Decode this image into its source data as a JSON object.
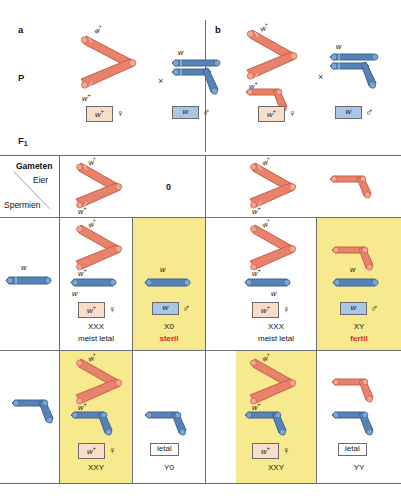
{
  "figure": {
    "type": "genetics-punnett-square",
    "language": "de",
    "panels": [
      "a",
      "b"
    ],
    "colors": {
      "maternal_chromosome": "#e8826b",
      "paternal_chromosome": "#5583b8",
      "highlight_cell": "#f7e98e",
      "grid_line": "#4a6fa5",
      "grid_line_thick": "#6e6f74",
      "female_chip": "#f8ddc8",
      "male_chip": "#a8c6e8",
      "annotation_red": "#e2251b"
    }
  },
  "labels": {
    "panel_a": "a",
    "panel_b": "b",
    "parental_row": "P",
    "f1_row": "F",
    "f1_sub": "1",
    "gameten": "Gameten",
    "eier": "Eier",
    "spermien": "Spermien",
    "cross_symbol": "×",
    "nullo_gamete": "0",
    "allele_wildtype": "w",
    "allele_wildtype_sup": "+",
    "allele_mutant": "w",
    "female_symbol": "♀",
    "male_symbol": "♂"
  },
  "parents": {
    "a": {
      "mother": {
        "chip": "w",
        "chip_sup": "+",
        "sex": "♀",
        "chromosome_labels": [
          "w+",
          "w+"
        ],
        "structure": "attached-X (compound X), no Y"
      },
      "father": {
        "chip": "w",
        "chip_sup": "",
        "sex": "♂",
        "chromosome_labels": [
          "w"
        ],
        "structure": "X (w) plus bent Y"
      }
    },
    "b": {
      "mother": {
        "chip": "w",
        "chip_sup": "+",
        "sex": "♀",
        "chromosome_labels": [
          "w+",
          "w+"
        ],
        "structure": "attached-X (compound X) plus Y"
      },
      "father": {
        "chip": "w",
        "chip_sup": "",
        "sex": "♂",
        "chromosome_labels": [
          "w"
        ],
        "structure": "X (w) plus bent Y"
      }
    }
  },
  "grid": {
    "a": {
      "egg_gametes": [
        {
          "id": "egg-a-1",
          "label": "attached-X",
          "marks": [
            "w+",
            "w+"
          ],
          "text": ""
        },
        {
          "id": "egg-a-2",
          "label": "nullo",
          "marks": [],
          "text": "0"
        }
      ],
      "sperm_gametes": [
        {
          "id": "sperm-a-1",
          "label": "X",
          "marks": [
            "w"
          ]
        },
        {
          "id": "sperm-a-2",
          "label": "Y",
          "marks": []
        }
      ],
      "cells": [
        {
          "id": "cell-a-11",
          "genotype": "XXX",
          "note": "meist letal",
          "note_color": "black",
          "highlight": false,
          "chip": "w",
          "chip_sup": "+",
          "chip_class": "female",
          "sex": "♀",
          "chromosome_marks": [
            "w+",
            "w+",
            "w"
          ]
        },
        {
          "id": "cell-a-12",
          "genotype": "X0",
          "note": "steril",
          "note_color": "red",
          "highlight": true,
          "chip": "w",
          "chip_sup": "",
          "chip_class": "male",
          "sex": "♂",
          "chromosome_marks": [
            "w"
          ]
        },
        {
          "id": "cell-a-21",
          "genotype": "XXY",
          "note": "",
          "note_color": "black",
          "highlight": true,
          "chip": "w",
          "chip_sup": "+",
          "chip_class": "female",
          "sex": "♀",
          "chromosome_marks": [
            "w+",
            "w+"
          ]
        },
        {
          "id": "cell-a-22",
          "genotype": "Y0",
          "note": "",
          "note_color": "black",
          "highlight": false,
          "chip": "letal",
          "chip_sup": "",
          "chip_class": "plain",
          "sex": "",
          "chromosome_marks": []
        }
      ]
    },
    "b": {
      "egg_gametes": [
        {
          "id": "egg-b-1",
          "label": "attached-X",
          "marks": [
            "w+",
            "w+"
          ],
          "text": ""
        },
        {
          "id": "egg-b-2",
          "label": "Y",
          "marks": [],
          "text": ""
        }
      ],
      "sperm_gametes": [
        {
          "id": "sperm-b-1",
          "label": "X",
          "marks": [
            "w"
          ]
        },
        {
          "id": "sperm-b-2",
          "label": "Y",
          "marks": []
        }
      ],
      "cells": [
        {
          "id": "cell-b-11",
          "genotype": "XXX",
          "note": "meist letal",
          "note_color": "black",
          "highlight": false,
          "chip": "w",
          "chip_sup": "+",
          "chip_class": "female",
          "sex": "♀",
          "chromosome_marks": [
            "w+",
            "w+",
            "w"
          ]
        },
        {
          "id": "cell-b-12",
          "genotype": "XY",
          "note": "fertil",
          "note_color": "red",
          "highlight": true,
          "chip": "w",
          "chip_sup": "",
          "chip_class": "male",
          "sex": "♂",
          "chromosome_marks": [
            "w"
          ]
        },
        {
          "id": "cell-b-21",
          "genotype": "XXY",
          "note": "",
          "note_color": "black",
          "highlight": true,
          "chip": "w",
          "chip_sup": "+",
          "chip_class": "female",
          "sex": "♀",
          "chromosome_marks": [
            "w+",
            "w+"
          ]
        },
        {
          "id": "cell-b-22",
          "genotype": "YY",
          "note": "",
          "note_color": "black",
          "highlight": false,
          "chip": "letal",
          "chip_sup": "",
          "chip_class": "plain",
          "sex": "",
          "chromosome_marks": []
        }
      ]
    }
  }
}
